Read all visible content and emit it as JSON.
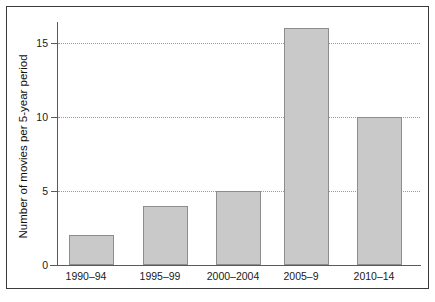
{
  "chart_data": {
    "type": "bar",
    "title": "",
    "subtitle": "",
    "xlabel": "",
    "ylabel": "Number of movies per 5-year period",
    "categories": [
      "1990–94",
      "1995–99",
      "2000–2004",
      "2005–9",
      "2010–14"
    ],
    "values": [
      2,
      4,
      5,
      16,
      10
    ],
    "series": [
      {
        "name": "Number of movies",
        "values": [
          2,
          4,
          5,
          16,
          10
        ]
      }
    ],
    "ylim": [
      0,
      16.5
    ],
    "xlim": [
      0,
      5
    ],
    "yticks": [
      0,
      5,
      10,
      15
    ],
    "ytick_labels": [
      "0",
      "5",
      "10",
      "15"
    ],
    "grid": true,
    "grid_axis": "y",
    "grid_style": "dotted",
    "legend": false,
    "legend_position": "none",
    "bar_fill_color": "#c9c9c9",
    "bar_edge_color": "#8d8d8d",
    "axis_color": "#5a5a5a",
    "grid_color": "#9a9a9a",
    "frame_color": "#3a3a3a",
    "background_color": "#ffffff",
    "text_color": "#1a1a1a"
  },
  "figure": {
    "frame_visible": true
  }
}
